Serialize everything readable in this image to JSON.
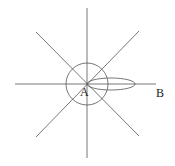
{
  "diagram": {
    "points": {
      "A": {
        "label": "A"
      },
      "B": {
        "label": "B"
      }
    },
    "colors": {
      "stroke": "#555555",
      "text": "#222222",
      "background": "#ffffff"
    },
    "elements": [
      "vertical line through A",
      "horizontal line through A toward B",
      "two diagonal lines through A",
      "circle centered at A",
      "elongated ellipse from A toward B"
    ]
  }
}
